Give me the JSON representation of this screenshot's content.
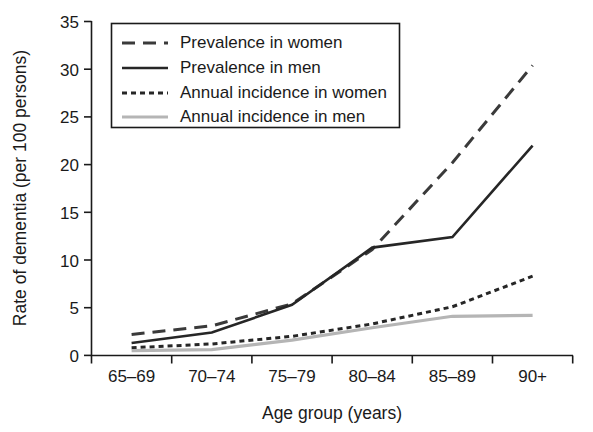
{
  "chart_data": {
    "type": "line",
    "title": "",
    "xlabel": "Age group (years)",
    "ylabel": "Rate of dementia (per 100 persons)",
    "categories": [
      "65–69",
      "70–74",
      "75–79",
      "80–84",
      "85–89",
      "90+"
    ],
    "ylim": [
      0,
      35
    ],
    "yticks": [
      0,
      5,
      10,
      15,
      20,
      25,
      30,
      35
    ],
    "ytick_labels": [
      "0",
      "5",
      "10",
      "15",
      "20",
      "25",
      "30",
      "35"
    ],
    "grid": false,
    "legend_position": "top-left-inside",
    "series": [
      {
        "name": "Prevalence in women",
        "style": "dashed-long",
        "color": "#3a3a3a",
        "width": 3.0,
        "dash": "13,8",
        "values": [
          2.2,
          3.1,
          5.4,
          11.1,
          20.2,
          30.4
        ]
      },
      {
        "name": "Prevalence in men",
        "style": "solid",
        "color": "#262626",
        "width": 2.6,
        "dash": "",
        "values": [
          1.3,
          2.4,
          5.3,
          11.3,
          12.4,
          22.0
        ]
      },
      {
        "name": "Annual incidence in women",
        "style": "dotted-short",
        "color": "#262626",
        "width": 3.0,
        "dash": "5,4",
        "values": [
          0.8,
          1.2,
          2.0,
          3.3,
          5.1,
          8.3
        ]
      },
      {
        "name": "Annual incidence in men",
        "style": "solid",
        "color": "#b5b5b5",
        "width": 3.2,
        "dash": "",
        "values": [
          0.5,
          0.6,
          1.6,
          2.9,
          4.1,
          4.2
        ]
      }
    ]
  },
  "legend": {
    "entries": [
      "Prevalence in women",
      "Prevalence in men",
      "Annual incidence in women",
      "Annual incidence in men"
    ]
  },
  "axes": {
    "y_title": "Rate of dementia (per 100 persons)",
    "x_title": "Age group (years)"
  },
  "colors": {
    "ink": "#1a1a1a",
    "dark_series": "#262626",
    "mid_series": "#3a3a3a",
    "gray_series": "#b5b5b5",
    "background": "#ffffff"
  }
}
